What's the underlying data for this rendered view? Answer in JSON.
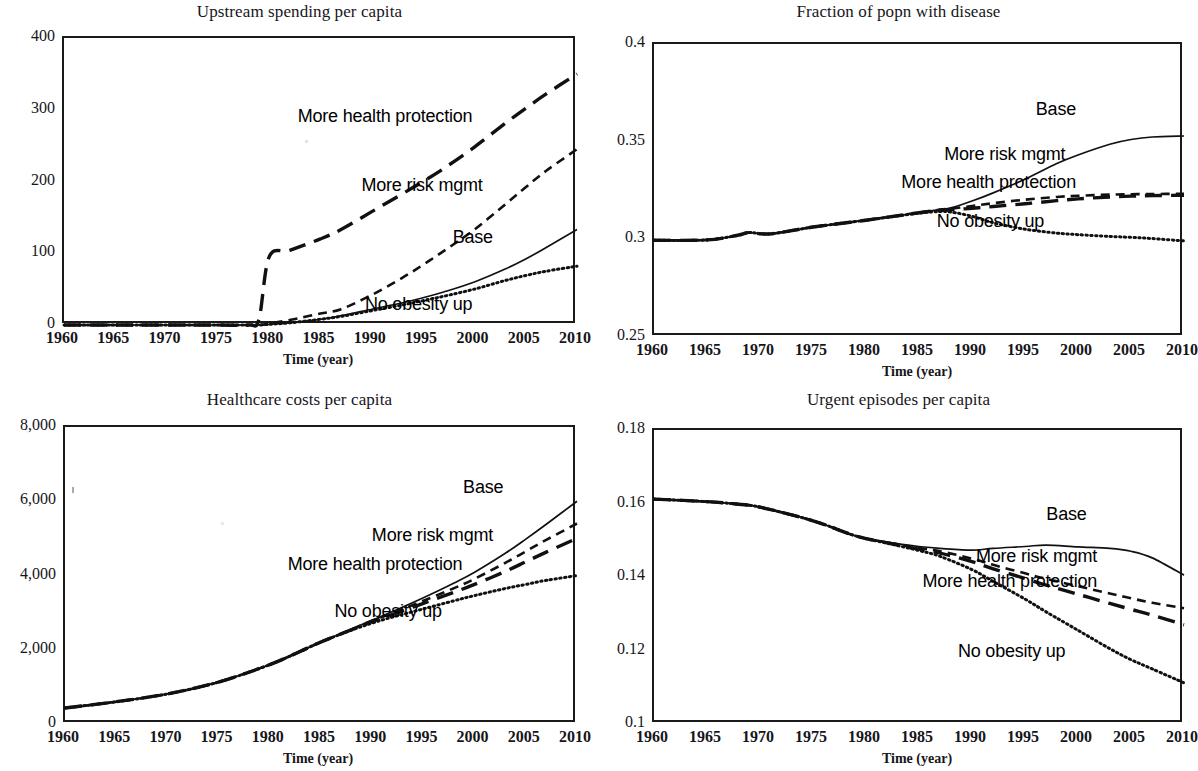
{
  "figure": {
    "shared_xlabel": "Time (year)",
    "shared_xticks": [
      "1960",
      "1965",
      "1970",
      "1975",
      "1980",
      "1985",
      "1990",
      "1995",
      "2000",
      "2005",
      "2010"
    ],
    "series_names": [
      "Base",
      "More risk mgmt",
      "More health protection",
      "No obesity up"
    ],
    "line_color": "#111111"
  },
  "chart_data": [
    {
      "id": "upstream-spending",
      "type": "line",
      "title": "Upstream spending per capita",
      "xlabel": "Time (year)",
      "ylabel": "",
      "xlim": [
        1960,
        2010
      ],
      "ylim": [
        0,
        400
      ],
      "xticks": [
        1960,
        1965,
        1970,
        1975,
        1980,
        1985,
        1990,
        1995,
        2000,
        2005,
        2010
      ],
      "yticks": [
        0,
        100,
        200,
        300,
        400
      ],
      "ytick_labels": [
        "0",
        "100",
        "200",
        "300",
        "400"
      ],
      "grid": false,
      "legend": "inline-annotations",
      "x": [
        1960,
        1965,
        1970,
        1975,
        1978,
        1979,
        1980,
        1982,
        1985,
        1987,
        1990,
        1993,
        1995,
        1997,
        2000,
        2003,
        2005,
        2007,
        2010
      ],
      "series": [
        {
          "name": "Base",
          "style": "solid",
          "label_x": 2002,
          "label_y": 120,
          "values": [
            0,
            0,
            0,
            0,
            0,
            0,
            1,
            3,
            8,
            13,
            22,
            31,
            38,
            46,
            60,
            78,
            92,
            108,
            133
          ]
        },
        {
          "name": "More risk mgmt",
          "style": "short-dash",
          "label_x": 2001,
          "label_y": 193,
          "values": [
            0,
            0,
            0,
            0,
            0,
            0,
            2,
            7,
            16,
            22,
            42,
            66,
            84,
            103,
            133,
            168,
            192,
            215,
            245
          ]
        },
        {
          "name": "More health protection",
          "style": "long-dash",
          "label_x": 2000,
          "label_y": 288,
          "values": [
            0,
            0,
            0,
            0,
            0,
            8,
            95,
            104,
            120,
            133,
            158,
            183,
            200,
            218,
            248,
            281,
            302,
            322,
            350
          ]
        },
        {
          "name": "No obesity up",
          "style": "dotted",
          "label_x": 2000,
          "label_y": 27,
          "values": [
            0,
            0,
            0,
            0,
            0,
            0,
            1,
            3,
            8,
            12,
            20,
            28,
            34,
            40,
            50,
            62,
            69,
            75,
            82
          ]
        }
      ]
    },
    {
      "id": "fraction-with-disease",
      "type": "line",
      "title": "Fraction of popn with disease",
      "xlabel": "Time (year)",
      "ylabel": "",
      "xlim": [
        1960,
        2010
      ],
      "ylim": [
        0.25,
        0.4
      ],
      "xticks": [
        1960,
        1965,
        1970,
        1975,
        1980,
        1985,
        1990,
        1995,
        2000,
        2005,
        2010
      ],
      "yticks": [
        0.25,
        0.3,
        0.35,
        0.4
      ],
      "ytick_labels": [
        "0.25",
        "0.3",
        "0.35",
        "0.4"
      ],
      "grid": false,
      "legend": "inline-annotations",
      "x": [
        1960,
        1965,
        1968,
        1969,
        1971,
        1975,
        1980,
        1985,
        1987,
        1988,
        1990,
        1992,
        1995,
        1998,
        2000,
        2003,
        2005,
        2007,
        2010
      ],
      "series": [
        {
          "name": "Base",
          "style": "solid",
          "label_x": 2000,
          "label_y": 0.3655,
          "values": [
            0.2995,
            0.2997,
            0.3022,
            0.3035,
            0.3028,
            0.3063,
            0.3098,
            0.3137,
            0.3153,
            0.3161,
            0.3196,
            0.3238,
            0.3308,
            0.3388,
            0.3432,
            0.3487,
            0.3511,
            0.3524,
            0.3529
          ]
        },
        {
          "name": "More risk mgmt",
          "style": "short-dash",
          "label_x": 1999,
          "label_y": 0.3425,
          "values": [
            0.2995,
            0.2997,
            0.3022,
            0.3035,
            0.3028,
            0.3063,
            0.3098,
            0.3137,
            0.3152,
            0.3157,
            0.3171,
            0.3185,
            0.3203,
            0.3217,
            0.3223,
            0.3229,
            0.3231,
            0.3232,
            0.3233
          ]
        },
        {
          "name": "More health protection",
          "style": "long-dash",
          "label_x": 2000,
          "label_y": 0.3285,
          "values": [
            0.2995,
            0.2997,
            0.3022,
            0.3035,
            0.3028,
            0.3063,
            0.3098,
            0.3136,
            0.3148,
            0.3151,
            0.3159,
            0.3168,
            0.3182,
            0.3198,
            0.3207,
            0.3217,
            0.3221,
            0.3224,
            0.3226
          ]
        },
        {
          "name": "No obesity up",
          "style": "dotted",
          "label_x": 1997,
          "label_y": 0.3085,
          "values": [
            0.2995,
            0.2997,
            0.3022,
            0.3035,
            0.3028,
            0.3063,
            0.3098,
            0.3134,
            0.3142,
            0.314,
            0.3118,
            0.3085,
            0.3052,
            0.3032,
            0.3024,
            0.3015,
            0.301,
            0.3004,
            0.2992
          ]
        }
      ]
    },
    {
      "id": "healthcare-costs",
      "type": "line",
      "title": "Healthcare costs per capita",
      "xlabel": "Time (year)",
      "ylabel": "",
      "xlim": [
        1960,
        2010
      ],
      "ylim": [
        0,
        8000
      ],
      "xticks": [
        1960,
        1965,
        1970,
        1975,
        1980,
        1985,
        1990,
        1995,
        2000,
        2005,
        2010
      ],
      "yticks": [
        0,
        2000,
        4000,
        6000,
        8000
      ],
      "ytick_labels": [
        "0",
        "2,000",
        "4,000",
        "6,000",
        "8,000"
      ],
      "grid": false,
      "legend": "inline-annotations",
      "x": [
        1960,
        1965,
        1970,
        1975,
        1980,
        1983,
        1985,
        1988,
        1990,
        1992,
        1995,
        1998,
        2000,
        2003,
        2005,
        2007,
        2010
      ],
      "series": [
        {
          "name": "Base",
          "style": "solid",
          "label_x": 2003,
          "label_y": 6320,
          "values": [
            430,
            600,
            810,
            1130,
            1600,
            1960,
            2210,
            2560,
            2800,
            3030,
            3400,
            3800,
            4090,
            4600,
            4980,
            5380,
            6000
          ]
        },
        {
          "name": "More risk mgmt",
          "style": "short-dash",
          "label_x": 2002,
          "label_y": 5050,
          "values": [
            430,
            600,
            810,
            1130,
            1600,
            1960,
            2210,
            2550,
            2780,
            2990,
            3320,
            3660,
            3910,
            4340,
            4650,
            4960,
            5400
          ]
        },
        {
          "name": "More health protection",
          "style": "long-dash",
          "label_x": 1999,
          "label_y": 4250,
          "values": [
            430,
            600,
            810,
            1130,
            1600,
            1960,
            2210,
            2540,
            2760,
            2950,
            3250,
            3550,
            3760,
            4110,
            4370,
            4630,
            5000
          ]
        },
        {
          "name": "No obesity up",
          "style": "dotted",
          "label_x": 1997,
          "label_y": 2980,
          "values": [
            430,
            600,
            810,
            1130,
            1600,
            1960,
            2210,
            2530,
            2720,
            2880,
            3100,
            3320,
            3460,
            3650,
            3760,
            3870,
            4000
          ]
        }
      ]
    },
    {
      "id": "urgent-episodes",
      "type": "line",
      "title": "Urgent episodes per capita",
      "xlabel": "Time (year)",
      "ylabel": "",
      "xlim": [
        1960,
        2010
      ],
      "ylim": [
        0.1,
        0.18
      ],
      "xticks": [
        1960,
        1965,
        1970,
        1975,
        1980,
        1985,
        1990,
        1995,
        2000,
        2005,
        2010
      ],
      "yticks": [
        0.1,
        0.12,
        0.14,
        0.16,
        0.18
      ],
      "ytick_labels": [
        "0.1",
        "0.12",
        "0.14",
        "0.16",
        "0.18"
      ],
      "grid": false,
      "legend": "inline-annotations",
      "x": [
        1960,
        1965,
        1968,
        1970,
        1975,
        1979,
        1982,
        1985,
        1987,
        1990,
        1992,
        1995,
        1997,
        2000,
        2003,
        2005,
        2007,
        2010
      ],
      "series": [
        {
          "name": "Base",
          "style": "solid",
          "label_x": 2001,
          "label_y": 0.1565,
          "values": [
            0.1612,
            0.1605,
            0.1598,
            0.159,
            0.1553,
            0.1512,
            0.1495,
            0.1483,
            0.1478,
            0.1473,
            0.1478,
            0.1483,
            0.1487,
            0.1482,
            0.1478,
            0.147,
            0.1452,
            0.1405
          ]
        },
        {
          "name": "More risk mgmt",
          "style": "short-dash",
          "label_x": 2002,
          "label_y": 0.1452,
          "values": [
            0.1612,
            0.1605,
            0.1598,
            0.159,
            0.1553,
            0.1512,
            0.1494,
            0.1479,
            0.147,
            0.145,
            0.1433,
            0.141,
            0.1395,
            0.1375,
            0.1355,
            0.1342,
            0.133,
            0.1315
          ]
        },
        {
          "name": "More health protection",
          "style": "long-dash",
          "label_x": 2002,
          "label_y": 0.1383,
          "values": [
            0.1612,
            0.1605,
            0.1598,
            0.159,
            0.1553,
            0.1512,
            0.1493,
            0.1476,
            0.1465,
            0.1442,
            0.1422,
            0.1396,
            0.1378,
            0.1353,
            0.1328,
            0.1312,
            0.1296,
            0.127
          ]
        },
        {
          "name": "No obesity up",
          "style": "dotted",
          "label_x": 1999,
          "label_y": 0.1192,
          "values": [
            0.1612,
            0.1605,
            0.1598,
            0.159,
            0.1553,
            0.1512,
            0.1492,
            0.1472,
            0.1456,
            0.142,
            0.1388,
            0.134,
            0.1305,
            0.1255,
            0.1205,
            0.1175,
            0.115,
            0.1112
          ]
        }
      ]
    }
  ]
}
